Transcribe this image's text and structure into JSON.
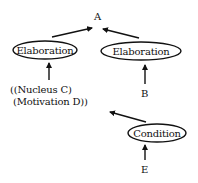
{
  "diagram": {
    "type": "rhetorical-structure-tree",
    "root": {
      "label": "A"
    },
    "nodes": [
      {
        "id": "elab1",
        "label": "Elaboration",
        "shape": "ellipse"
      },
      {
        "id": "elab2",
        "label": "Elaboration",
        "shape": "ellipse"
      },
      {
        "id": "cond",
        "label": "Condition",
        "shape": "ellipse"
      }
    ],
    "leaves": {
      "nucleus_line1": "((Nucleus C)",
      "nucleus_line2": " (Motivation D))",
      "b": "B",
      "e": "E"
    },
    "edges": [
      {
        "from": "elab1",
        "to": "A"
      },
      {
        "from": "elab2",
        "to": "A"
      },
      {
        "from": "((Nucleus C) (Motivation D))",
        "to": "elab1"
      },
      {
        "from": "B",
        "to": "elab2"
      },
      {
        "from": "cond",
        "to": "((Nucleus C) (Motivation D))"
      },
      {
        "from": "E",
        "to": "cond"
      }
    ],
    "colors": {
      "ink": "#111111",
      "background": "#ffffff"
    }
  }
}
